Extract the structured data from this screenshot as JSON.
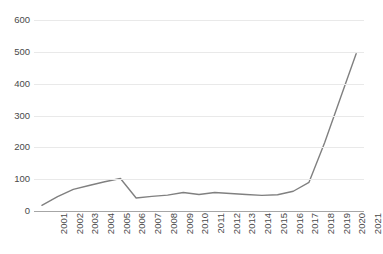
{
  "chart_data": {
    "type": "line",
    "title": "",
    "xlabel": "",
    "ylabel": "",
    "categories": [
      "2001",
      "2002",
      "2003",
      "2004",
      "2005",
      "2006",
      "2007",
      "2008",
      "2009",
      "2010",
      "2011",
      "2012",
      "2013",
      "2014",
      "2015",
      "2016",
      "2017",
      "2018",
      "2019",
      "2020",
      "2021"
    ],
    "values": [
      18,
      45,
      68,
      80,
      92,
      102,
      41,
      46,
      50,
      58,
      52,
      58,
      55,
      52,
      49,
      51,
      62,
      90,
      215,
      355,
      494
    ],
    "series": [
      {
        "name": "Publications",
        "values": [
          18,
          45,
          68,
          80,
          92,
          102,
          41,
          46,
          50,
          58,
          52,
          58,
          55,
          52,
          49,
          51,
          62,
          90,
          215,
          355,
          494
        ]
      }
    ],
    "ylim": [
      0,
      600
    ],
    "yticks": [
      0,
      100,
      200,
      300,
      400,
      500,
      600
    ],
    "ytick_labels": [
      "0",
      "100",
      "200",
      "300",
      "400",
      "500",
      "600"
    ],
    "grid": true,
    "legend": false,
    "legend_position": "none",
    "line_color": "#808080",
    "gridline_color": "#e9e9e9",
    "axis_color": "#a6a6a6"
  }
}
